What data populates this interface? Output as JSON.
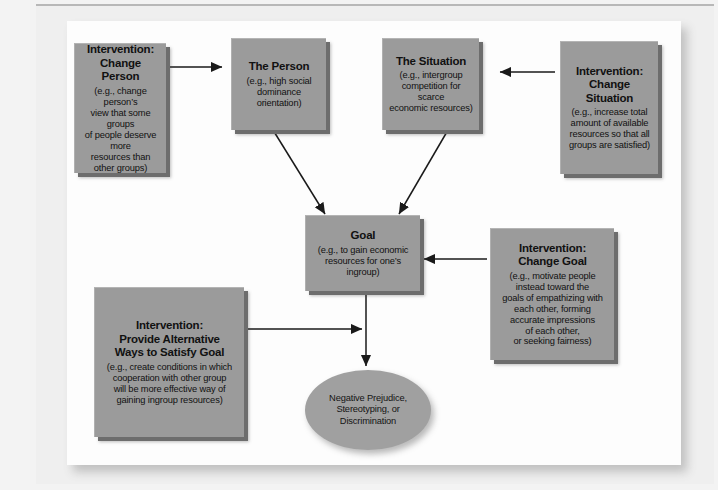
{
  "figure": {
    "type": "flow-diagram",
    "accent_box_fill": "#9b9b9b",
    "accent_box_shadow": "#6d6d6d",
    "outcome_fill": "#a0a0a0",
    "connector_color": "#1a1a1a",
    "page_background": "#efefef",
    "panel_background": "#fdfdfd"
  },
  "nodes": {
    "change_person": {
      "heading": "Intervention:\nChange Person",
      "detail": "(e.g., change person’s\nview that some groups\nof people deserve more\nresources than\nother groups)"
    },
    "the_person": {
      "heading": "The Person",
      "detail": "(e.g., high social\ndominance orientation)"
    },
    "the_situation": {
      "heading": "The Situation",
      "detail": "(e.g., intergroup\ncompetition for scarce\neconomic resources)"
    },
    "change_situation": {
      "heading": "Intervention:\nChange Situation",
      "detail": "(e.g., increase total\namount of available\nresources so that all\ngroups are satisfied)"
    },
    "goal": {
      "heading": "Goal",
      "detail": "(e.g., to gain economic\nresources for one’s\ningroup)"
    },
    "change_goal": {
      "heading": "Intervention:\nChange Goal",
      "detail": "(e.g., motivate people\ninstead toward the\ngoals of empathizing with\neach other, forming\naccurate impressions\nof each other,\nor seeking fairness)"
    },
    "provide_alternative": {
      "heading": "Intervention:\nProvide Alternative\nWays to Satisfy Goal",
      "detail": "(e.g., create conditions in which\ncooperation with other group\nwill be more effective way of\ngaining ingroup resources)"
    },
    "outcome": {
      "label": "Negative Prejudice,\nStereotyping, or\nDiscrimination"
    }
  },
  "connectors": [
    {
      "name": "change-person-to-the-person",
      "from": "change_person",
      "to": "the_person",
      "direction": "right"
    },
    {
      "name": "the-person-to-goal",
      "from": "the_person",
      "to": "goal",
      "direction": "down-right"
    },
    {
      "name": "the-situation-to-goal",
      "from": "the_situation",
      "to": "goal",
      "direction": "down-left"
    },
    {
      "name": "change-situation-to-the-situation",
      "from": "change_situation",
      "to": "the_situation",
      "direction": "left"
    },
    {
      "name": "change-goal-to-goal",
      "from": "change_goal",
      "to": "goal",
      "direction": "left"
    },
    {
      "name": "goal-to-outcome",
      "from": "goal",
      "to": "outcome",
      "direction": "down"
    },
    {
      "name": "provide-alternative-to-goal-outcome-path",
      "from": "provide_alternative",
      "to": "goal_to_outcome_path",
      "direction": "right"
    }
  ]
}
